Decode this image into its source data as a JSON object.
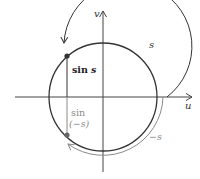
{
  "diagram": {
    "axes": {
      "horizontal_label": "u",
      "vertical_label": "v"
    },
    "labels": {
      "sin_s_fn": "sin",
      "sin_s_arg": "s",
      "sin_neg_s_fn": "sin",
      "sin_neg_s_arg": "(−s)",
      "arc_s": "s",
      "arc_neg_s": "−s"
    },
    "colors": {
      "primary": "#333333",
      "secondary": "#8a8a8a",
      "axis": "#444444",
      "background": "#ffffff"
    }
  }
}
